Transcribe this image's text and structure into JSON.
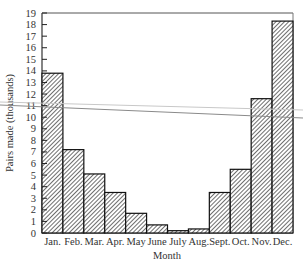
{
  "chart_data": {
    "type": "bar",
    "title": "",
    "xlabel": "Month",
    "ylabel": "Pairs made (thousands)",
    "categories": [
      "Jan.",
      "Feb.",
      "Mar.",
      "Apr.",
      "May",
      "June",
      "July",
      "Aug.",
      "Sept.",
      "Oct.",
      "Nov.",
      "Dec."
    ],
    "values": [
      13.8,
      7.2,
      5.1,
      3.5,
      1.7,
      0.7,
      0.2,
      0.35,
      3.5,
      5.5,
      11.6,
      18.3
    ],
    "ylim": [
      0,
      19
    ],
    "yticks": [
      0,
      1,
      2,
      3,
      4,
      5,
      6,
      7,
      8,
      9,
      10,
      11,
      12,
      13,
      14,
      15,
      16,
      17,
      18,
      19
    ],
    "grid": false,
    "legend": null,
    "bar_fill": "hatched (diagonal lines)",
    "colors": {
      "bar_stroke": "#111111",
      "hatch": "#555555",
      "frame": "#333333"
    }
  },
  "labels": {
    "xlabel": "Month",
    "ylabel": "Pairs made (thousands)"
  }
}
